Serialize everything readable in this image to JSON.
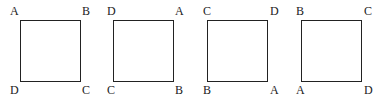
{
  "figures": [
    {
      "corners": {
        "top_left": "A",
        "top_right": "B",
        "bottom_left": "D",
        "bottom_right": "C"
      }
    },
    {
      "corners": {
        "top_left": "D",
        "top_right": "A",
        "bottom_left": "C",
        "bottom_right": "B"
      }
    },
    {
      "corners": {
        "top_left": "C",
        "top_right": "D",
        "bottom_left": "B",
        "bottom_right": "A"
      }
    },
    {
      "corners": {
        "top_left": "B",
        "top_right": "C",
        "bottom_left": "A",
        "bottom_right": "D"
      }
    }
  ]
}
